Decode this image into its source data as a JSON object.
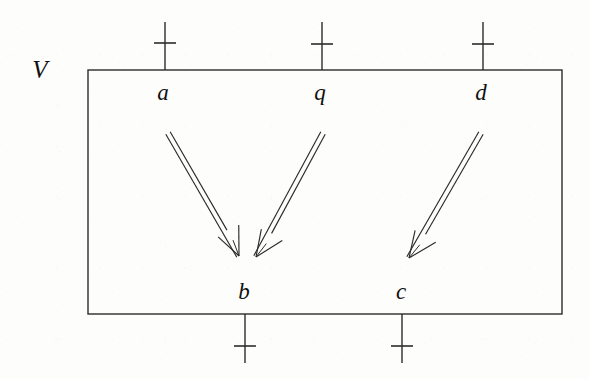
{
  "figure": {
    "kind": "petri-net-module-diagram",
    "background_color": "#fdfdfb",
    "ink_color": "#2b2b2b",
    "text_color": "#111111",
    "container": {
      "label": "V",
      "label_x": 40,
      "label_y": 82,
      "x": 88,
      "y": 70,
      "width": 474,
      "height": 244,
      "stroke_width": 1.4
    },
    "ports": [
      {
        "id": "port-a",
        "label": "a",
        "side": "top",
        "x": 165,
        "stub_start_y": 22,
        "stub_end_y": 70,
        "tick_y": 43,
        "tick_half_width": 11,
        "label_x": 163,
        "label_y": 104
      },
      {
        "id": "port-q",
        "label": "q",
        "side": "top",
        "x": 322,
        "stub_start_y": 22,
        "stub_end_y": 70,
        "tick_y": 44,
        "tick_half_width": 11,
        "label_x": 320,
        "label_y": 104
      },
      {
        "id": "port-d",
        "label": "d",
        "side": "top",
        "x": 483,
        "stub_start_y": 22,
        "stub_end_y": 70,
        "tick_y": 44,
        "tick_half_width": 11,
        "label_x": 481,
        "label_y": 104
      },
      {
        "id": "port-b",
        "label": "b",
        "side": "bottom",
        "x": 245,
        "stub_start_y": 314,
        "stub_end_y": 363,
        "tick_y": 346,
        "tick_half_width": 11,
        "label_x": 244,
        "label_y": 303
      },
      {
        "id": "port-c",
        "label": "c",
        "side": "bottom",
        "x": 402,
        "stub_start_y": 314,
        "stub_end_y": 363,
        "tick_y": 346,
        "tick_half_width": 11,
        "label_x": 401,
        "label_y": 303
      }
    ],
    "arrows": [
      {
        "id": "arrow-a-to-b",
        "from": "a",
        "to": "b",
        "x1": 168,
        "y1": 133,
        "x2": 239,
        "y2": 256,
        "style": "double-line-open-head",
        "gap": 5.0,
        "head_length": 27,
        "head_spread": 17
      },
      {
        "id": "arrow-q-to-b",
        "from": "q",
        "to": "b",
        "x1": 323,
        "y1": 133,
        "x2": 256,
        "y2": 257,
        "style": "double-line-open-head",
        "gap": 5.0,
        "head_length": 27,
        "head_spread": 17
      },
      {
        "id": "arrow-d-to-c",
        "from": "d",
        "to": "c",
        "x1": 481,
        "y1": 133,
        "x2": 409,
        "y2": 258,
        "style": "double-line-open-head",
        "gap": 5.0,
        "head_length": 27,
        "head_spread": 17
      }
    ]
  }
}
